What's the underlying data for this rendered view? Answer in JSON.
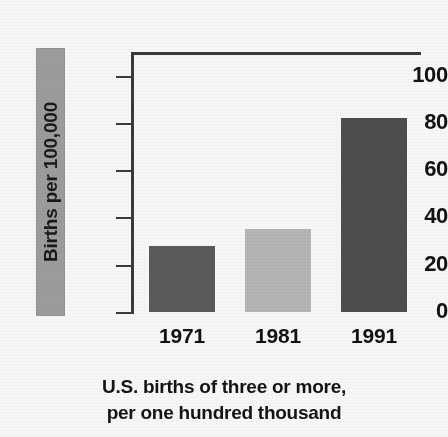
{
  "chart_data": {
    "type": "bar",
    "title": "",
    "subtitle": "",
    "caption_line1": "U.S. births of three or more,",
    "caption_line2": "per one hundred thousand",
    "categories": [
      "1971",
      "1981",
      "1991"
    ],
    "values": [
      28,
      35,
      82
    ],
    "series": [
      {
        "name": "U.S. births of three or more per 100,000",
        "values": [
          28,
          35,
          82
        ]
      }
    ],
    "xlabel": "",
    "ylabel": "Births per 100,000",
    "ylim": [
      0,
      110
    ],
    "yticks": [
      0,
      20,
      40,
      60,
      80,
      100
    ],
    "ytick_labels": [
      "0",
      "20",
      "40",
      "60",
      "80",
      "100"
    ],
    "grid": false,
    "legend": "none",
    "bar_colors": [
      "#5a5a5a",
      "#b5b5b5",
      "#4e4e4e"
    ],
    "axis_color": "#3a3a3a",
    "background_color": "#f7f7f5",
    "ylabel_band_color": "#9c9c9c"
  }
}
